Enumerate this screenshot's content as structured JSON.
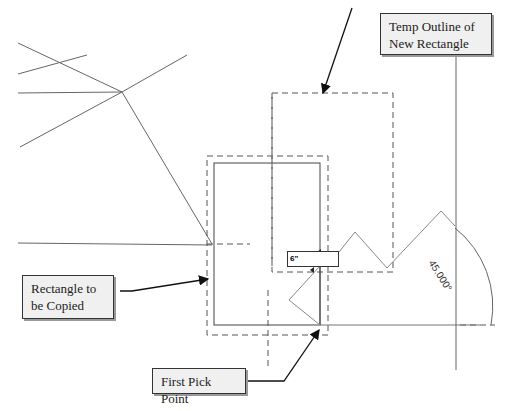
{
  "callouts": {
    "temp_outline": "Temp Outline of\nNew Rectangle",
    "temp_outline_line1": "Temp Outline of",
    "temp_outline_line2": "New Rectangle",
    "rect_to_copy_line1": "Rectangle to",
    "rect_to_copy_line2": "be Copied",
    "first_pick": "First Pick Point"
  },
  "dimension_input": {
    "value": "6\""
  },
  "angle_dimension": {
    "value": "45.000°"
  },
  "colors": {
    "line": "#555555",
    "dash": "#555555",
    "callout_bg": "#f0f0f0",
    "callout_border": "#333333"
  }
}
